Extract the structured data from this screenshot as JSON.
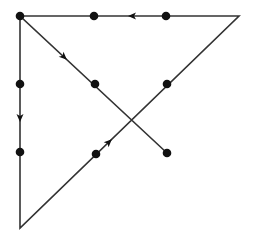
{
  "diagram": {
    "title": "",
    "colors": {
      "line": "#333333",
      "dot": "#111111",
      "background": "#ffffff"
    },
    "dots": [
      {
        "id": "d11",
        "x": 20,
        "y": 16
      },
      {
        "id": "d12",
        "x": 94,
        "y": 16
      },
      {
        "id": "d13",
        "x": 166,
        "y": 16
      },
      {
        "id": "d21",
        "x": 20,
        "y": 84
      },
      {
        "id": "d22",
        "x": 95,
        "y": 84
      },
      {
        "id": "d23",
        "x": 167,
        "y": 84
      },
      {
        "id": "d31",
        "x": 20,
        "y": 152
      },
      {
        "id": "d32",
        "x": 96,
        "y": 154
      },
      {
        "id": "d33",
        "x": 167,
        "y": 153
      }
    ],
    "path": [
      {
        "x": 20,
        "y": 16
      },
      {
        "x": 20,
        "y": 228
      },
      {
        "x": 239,
        "y": 16
      },
      {
        "x": 20,
        "y": 16
      },
      {
        "x": 167,
        "y": 153
      }
    ],
    "arrows": [
      {
        "name": "arrow-left-top",
        "x": 132,
        "y": 16,
        "angle": 180
      },
      {
        "name": "arrow-down-left",
        "x": 20,
        "y": 118,
        "angle": 90
      },
      {
        "name": "arrow-diag-down",
        "x": 64,
        "y": 57,
        "angle": 43
      },
      {
        "name": "arrow-diag-up",
        "x": 109,
        "y": 142,
        "angle": -44
      }
    ]
  }
}
